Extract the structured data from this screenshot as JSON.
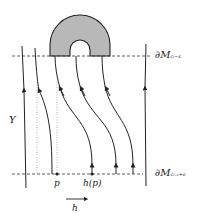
{
  "diagram": {
    "labels": {
      "top_boundary": "∂M",
      "top_boundary_sub": "cᵢ−ε",
      "bottom_boundary": "∂M",
      "bottom_boundary_sub": "cᵢ₋₁+ε",
      "region": "Y",
      "point": "p",
      "image_point": "h(p)",
      "map": "h"
    },
    "colors": {
      "stroke": "#222222",
      "fill_region": "#b8b8b8",
      "dashed": "#333333",
      "dotted": "#999999"
    }
  }
}
